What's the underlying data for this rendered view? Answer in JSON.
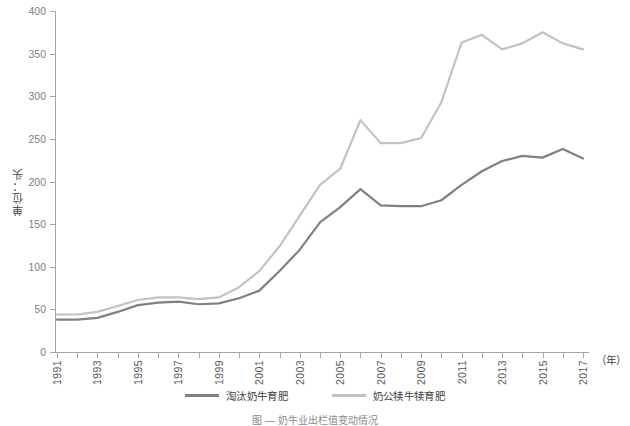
{
  "chart_data": {
    "type": "line",
    "title": "",
    "xlabel": "（年）",
    "ylabel": "单位：头",
    "ylim": [
      0,
      400
    ],
    "ytick_step": 50,
    "yticks": [
      "400",
      "350",
      "300",
      "250",
      "200",
      "150",
      "100",
      "50",
      "0"
    ],
    "grid": false,
    "legend_position": "bottom",
    "x": [
      1991,
      1992,
      1993,
      1994,
      1995,
      1996,
      1997,
      1998,
      1999,
      2000,
      2001,
      2002,
      2003,
      2004,
      2005,
      2006,
      2007,
      2008,
      2009,
      2010,
      2011,
      2012,
      2013,
      2014,
      2015,
      2016,
      2017
    ],
    "xtick_labels": [
      "1991",
      "",
      "1993",
      "",
      "1995",
      "",
      "1997",
      "",
      "1999",
      "",
      "2001",
      "",
      "2003",
      "",
      "2005",
      "",
      "2007",
      "",
      "2009",
      "",
      "2011",
      "",
      "2013",
      "",
      "2015",
      "",
      "2017"
    ],
    "series": [
      {
        "name": "淘汰奶牛育肥",
        "color": "#808080",
        "values": [
          38,
          38,
          40,
          47,
          55,
          58,
          59,
          56,
          57,
          63,
          72,
          95,
          120,
          152,
          170,
          191,
          172,
          171,
          171,
          178,
          196,
          212,
          224,
          230,
          228,
          238,
          227
        ]
      },
      {
        "name": "奶公犊牛犊育肥",
        "color": "#c2c2c2",
        "values": [
          44,
          44,
          47,
          54,
          61,
          64,
          64,
          62,
          64,
          76,
          95,
          124,
          160,
          196,
          215,
          272,
          245,
          245,
          251,
          293,
          363,
          372,
          355,
          362,
          375,
          362,
          355
        ]
      }
    ]
  },
  "axis": {
    "unit_label": "单位：头",
    "x_unit_label": "（年）"
  },
  "legend": {
    "items": [
      {
        "label": "淘汰奶牛育肥",
        "color": "#808080"
      },
      {
        "label": "奶公犊牛犊育肥",
        "color": "#c2c2c2"
      }
    ]
  },
  "caption": {
    "text": "图 — 奶牛业出栏值变动情况"
  }
}
